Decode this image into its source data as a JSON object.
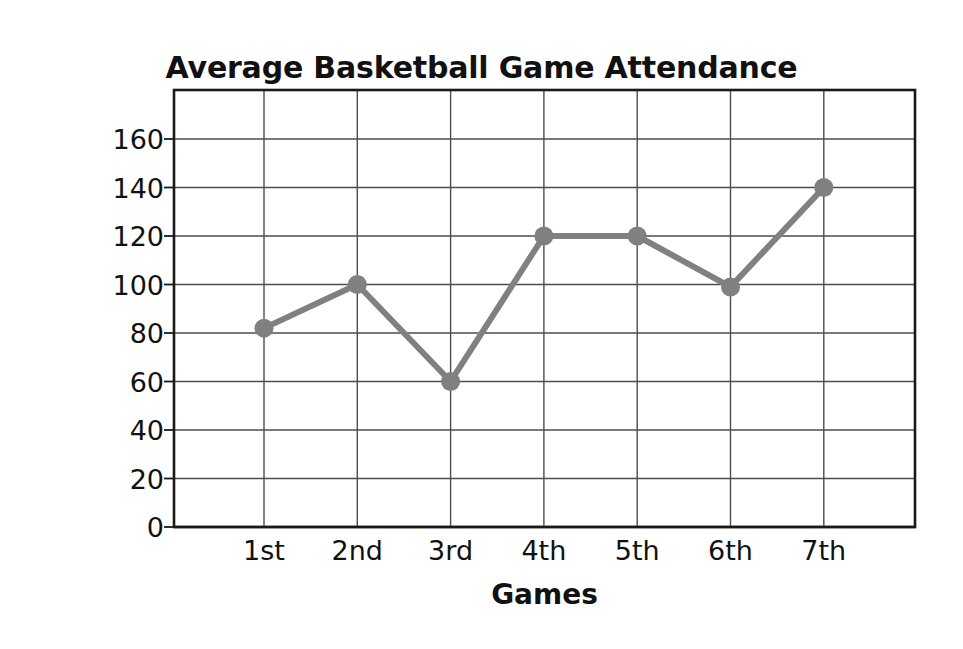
{
  "chart_data": {
    "type": "line",
    "title": "Average Basketball Game Attendance",
    "xlabel": "Games",
    "ylabel": "Number of Students",
    "categories": [
      "1st",
      "2nd",
      "3rd",
      "4th",
      "5th",
      "6th",
      "7th"
    ],
    "values": [
      82,
      100,
      60,
      120,
      120,
      99,
      140
    ],
    "series": [
      {
        "name": "Average Attendance",
        "values": [
          82,
          100,
          60,
          120,
          120,
          99,
          140
        ]
      }
    ],
    "ylim": [
      0,
      160
    ],
    "ytick_values": [
      0,
      20,
      40,
      60,
      80,
      100,
      120,
      140,
      160
    ],
    "ytick_labels": [
      "0",
      "20",
      "40",
      "60",
      "80",
      "100",
      "120",
      "140",
      "160"
    ],
    "xtick_labels": [
      "1st",
      "2nd",
      "3rd",
      "4th",
      "5th",
      "6th",
      "7th"
    ],
    "grid": "both",
    "legend": "none",
    "marker": "circle",
    "line_color": "#808080",
    "marker_color": "#808080",
    "axis_color": "#1a1a1a",
    "grid_color": "#4d4d4d",
    "background_color": "#ffffff"
  }
}
